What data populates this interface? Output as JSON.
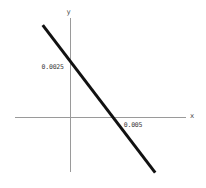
{
  "figure": {
    "background_color": "#ffffff",
    "axis_color": "#9a9a9a",
    "line_color": "#111111"
  },
  "chart_data": {
    "type": "line",
    "title": "",
    "xlabel": "x",
    "ylabel": "y",
    "grid": false,
    "legend": null,
    "xlim": [
      -0.00355,
      0.00755
    ],
    "ylim": [
      -0.00275,
      0.00498
    ],
    "xticks": [
      0.005
    ],
    "xticklabels": [
      "0.005"
    ],
    "yticks": [
      0.0025
    ],
    "yticklabels": [
      "0.0025"
    ],
    "series": [
      {
        "name": "line",
        "x": [
          -0.00175,
          0.00555
        ],
        "y": [
          0.00462,
          -0.00278
        ],
        "x_intercept": 0.005,
        "y_intercept": 0.0025,
        "slope": -0.5,
        "color": "#111111",
        "linewidth": 3
      }
    ]
  }
}
